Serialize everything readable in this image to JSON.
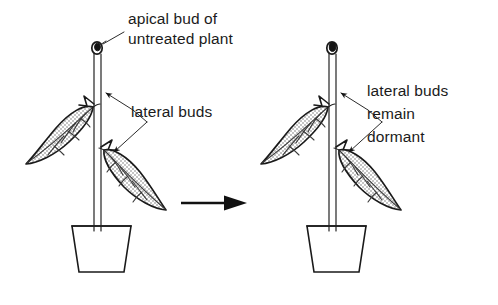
{
  "figure": {
    "background_color": "#ffffff",
    "ink_color": "#1a1a1a",
    "panels": [
      {
        "id": "left-panel",
        "name": "untreated-plant",
        "labels": [
          {
            "id": "apical-bud-label",
            "lines": [
              "apical bud of",
              "untreated plant"
            ]
          },
          {
            "id": "lateral-buds-label",
            "lines": [
              "lateral buds"
            ]
          }
        ],
        "parts": [
          "apical-bud",
          "stem",
          "upper-leaf",
          "lower-leaf",
          "upper-lateral-bud",
          "lower-lateral-bud",
          "flower-pot"
        ]
      },
      {
        "id": "right-panel",
        "name": "treated-plant",
        "labels": [
          {
            "id": "lateral-buds-dormant-label",
            "lines": [
              "lateral buds",
              "remain",
              "dormant"
            ]
          }
        ],
        "parts": [
          "apical-bud",
          "stem",
          "upper-leaf",
          "lower-leaf",
          "upper-lateral-bud",
          "lower-lateral-bud",
          "flower-pot"
        ]
      }
    ],
    "connector": {
      "id": "transition-arrow",
      "direction": "right"
    }
  },
  "text": {
    "apical_bud_line1": "apical bud of",
    "apical_bud_line2": "untreated plant",
    "lateral_buds": "lateral buds",
    "dormant_line1": "lateral buds",
    "dormant_line2": "remain",
    "dormant_line3": "dormant"
  }
}
